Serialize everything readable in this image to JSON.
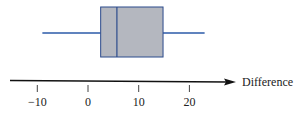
{
  "chart_data": {
    "type": "boxplot",
    "title": "",
    "xlabel": "Difference",
    "ylabel": "",
    "xlim": [
      -12,
      28
    ],
    "ticks": [
      -10,
      0,
      10,
      20
    ],
    "tick_labels": [
      "−10",
      "0",
      "10",
      "20"
    ],
    "grid": false,
    "legend": null,
    "box": {
      "min": -9,
      "q1": 2.5,
      "median": 5.7,
      "q3": 14.8,
      "max": 23
    },
    "colors": {
      "box_fill": "#b4b7bf",
      "box_edge": "#2b4a8c",
      "whisker": "#2b5aa8",
      "axis": "#111111"
    }
  }
}
